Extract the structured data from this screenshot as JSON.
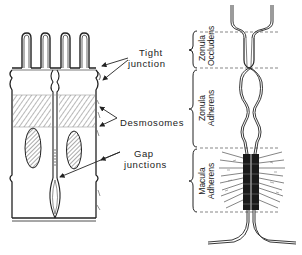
{
  "figure": {
    "left_panel": {
      "description": "two adjacent epithelial cells with microvilli, junctional complex and nuclei",
      "labels": {
        "tight_junction_line1": "Tight",
        "tight_junction_line2": "junction",
        "desmosomes": "Desmosomes",
        "gap_junctions_line1": "Gap",
        "gap_junctions_line2": "junctions"
      }
    },
    "right_panel": {
      "description": "junctional complex between two cell membranes",
      "regions": [
        {
          "line1": "Zonula",
          "line2": "Occludens"
        },
        {
          "line1": "Zonula",
          "line2": "Adherens"
        },
        {
          "line1": "Macula",
          "line2": "Adherens"
        }
      ]
    },
    "colors": {
      "ink": "#222222",
      "background": "#ffffff",
      "hatch": "#555555",
      "desmosome_dark": "#1a1a1a"
    }
  }
}
